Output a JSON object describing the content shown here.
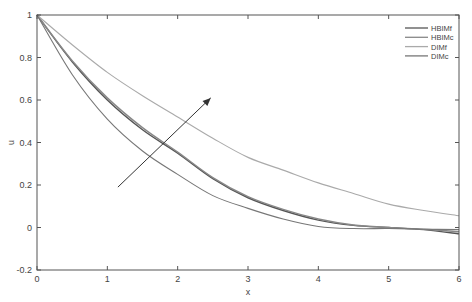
{
  "chart_data": {
    "type": "line",
    "title": "",
    "xlabel": "x",
    "ylabel": "u",
    "xlim": [
      0,
      6
    ],
    "ylim": [
      -0.2,
      1
    ],
    "xticks": [
      "0",
      "1",
      "2",
      "3",
      "4",
      "5",
      "6"
    ],
    "yticks": [
      "-0.2",
      "0",
      "0.2",
      "0.4",
      "0.6",
      "0.8",
      "1"
    ],
    "grid": false,
    "legend_position": "upper right",
    "x": [
      0,
      0.5,
      1,
      1.5,
      2,
      2.5,
      3,
      3.5,
      4,
      4.5,
      5,
      5.5,
      6
    ],
    "series": [
      {
        "name": "HBIMf",
        "color": "#555555",
        "values": [
          1.0,
          0.78,
          0.6,
          0.46,
          0.35,
          0.23,
          0.14,
          0.08,
          0.035,
          0.01,
          0.0,
          -0.01,
          -0.03
        ]
      },
      {
        "name": "HBIMc",
        "color": "#888888",
        "values": [
          1.0,
          0.785,
          0.61,
          0.47,
          0.355,
          0.235,
          0.145,
          0.085,
          0.04,
          0.012,
          0.0,
          -0.008,
          -0.02
        ]
      },
      {
        "name": "DIMf",
        "color": "#aaaaaa",
        "values": [
          1.0,
          0.86,
          0.73,
          0.62,
          0.52,
          0.42,
          0.33,
          0.27,
          0.21,
          0.16,
          0.11,
          0.08,
          0.055
        ]
      },
      {
        "name": "DIMc",
        "color": "#777777",
        "values": [
          1.0,
          0.72,
          0.51,
          0.36,
          0.25,
          0.15,
          0.09,
          0.04,
          0.005,
          -0.005,
          -0.005,
          -0.008,
          -0.01
        ]
      }
    ],
    "annotations": [
      {
        "type": "arrow",
        "from": [
          1.15,
          0.19
        ],
        "to": [
          2.47,
          0.61
        ]
      }
    ]
  }
}
